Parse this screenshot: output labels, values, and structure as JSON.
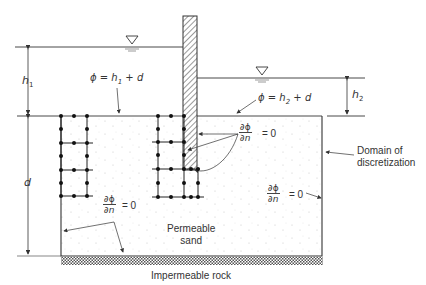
{
  "figure": {
    "labels": {
      "h1": "h",
      "h1_sub": "1",
      "h2": "h",
      "h2_sub": "2",
      "d": "d",
      "phi_left": "ϕ = h",
      "phi_left_sub": "1",
      "phi_left_tail": " + d",
      "phi_right": "ϕ = h",
      "phi_right_sub": "2",
      "phi_right_tail": " + d",
      "bc_num": "∂ϕ",
      "bc_den": "∂n",
      "bc_eq": "= 0",
      "domain_line1": "Domain of",
      "domain_line2": "discretization",
      "sand_line1": "Permeable",
      "sand_line2": "sand",
      "rock": "Impermeable rock"
    },
    "boundary_conditions": [
      {
        "location": "pile faces",
        "expr": "∂ϕ/∂n = 0"
      },
      {
        "location": "left boundary and bottom",
        "expr": "∂ϕ/∂n = 0"
      },
      {
        "location": "right boundary",
        "expr": "∂ϕ/∂n = 0"
      },
      {
        "location": "upstream ground surface",
        "expr": "ϕ = h1 + d"
      },
      {
        "location": "downstream ground surface",
        "expr": "ϕ = h2 + d"
      }
    ],
    "colors": {
      "line": "#333333",
      "pile_hatch": "#555555",
      "rock_hatch": "#666666",
      "sand_dots": "#bdbdbd"
    }
  }
}
